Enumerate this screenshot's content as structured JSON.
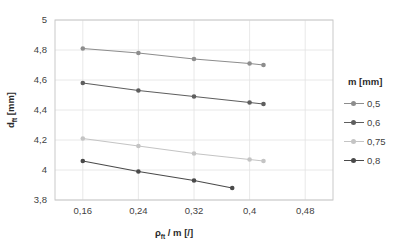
{
  "chart_data": {
    "type": "line",
    "title": "",
    "xlabel": "ρft / m [/]",
    "ylabel": "dft [mm]",
    "xlim": [
      0.12,
      0.52
    ],
    "ylim": [
      3.8,
      5.0
    ],
    "grid": true,
    "legend_position": "right",
    "legend_title": "m [mm]",
    "xticks": [
      "0,16",
      "0,24",
      "0,32",
      "0,4",
      "0,48"
    ],
    "xtick_values": [
      0.16,
      0.24,
      0.32,
      0.4,
      0.48
    ],
    "yticks": [
      "3,8",
      "4",
      "4,2",
      "4,4",
      "4,6",
      "4,8",
      "5"
    ],
    "ytick_values": [
      3.8,
      4.0,
      4.2,
      4.4,
      4.6,
      4.8,
      5.0
    ],
    "series": [
      {
        "name": "0,5",
        "color": "#8d8d8d",
        "x": [
          0.16,
          0.24,
          0.32,
          0.4,
          0.42
        ],
        "values": [
          4.81,
          4.78,
          4.74,
          4.71,
          4.7
        ]
      },
      {
        "name": "0,6",
        "color": "#5e5e5e",
        "x": [
          0.16,
          0.24,
          0.32,
          0.4,
          0.42
        ],
        "values": [
          4.58,
          4.53,
          4.49,
          4.45,
          4.44
        ]
      },
      {
        "name": "0,75",
        "color": "#c4c4c4",
        "x": [
          0.16,
          0.24,
          0.32,
          0.4,
          0.42
        ],
        "values": [
          4.21,
          4.16,
          4.11,
          4.07,
          4.06
        ]
      },
      {
        "name": "0,8",
        "color": "#4a4a4a",
        "x": [
          0.16,
          0.24,
          0.32,
          0.375
        ],
        "values": [
          4.06,
          3.99,
          3.93,
          3.88
        ]
      }
    ]
  },
  "axes": {
    "x_title_main": "ρ",
    "x_title_sub": "ft",
    "x_title_rest": " / m [/]",
    "y_title_main": "d",
    "y_title_sub": "ft",
    "y_title_rest": " [mm]"
  },
  "legend": {
    "title": "m [mm]",
    "items": [
      {
        "label": "0,5",
        "color": "#8d8d8d"
      },
      {
        "label": "0,6",
        "color": "#5e5e5e"
      },
      {
        "label": "0,75",
        "color": "#c4c4c4"
      },
      {
        "label": "0,8",
        "color": "#4a4a4a"
      }
    ]
  }
}
